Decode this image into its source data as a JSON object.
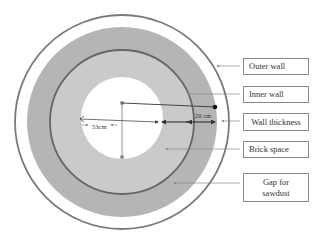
{
  "diagram": {
    "type": "concentric-circles cross-section",
    "labels": [
      {
        "id": "outer-wall",
        "text": "Outer wall"
      },
      {
        "id": "inner-wall",
        "text": "Inner wall"
      },
      {
        "id": "wall-thickness",
        "text": "Wall thickness"
      },
      {
        "id": "brick-space",
        "text": "Brick space"
      },
      {
        "id": "gap-sawdust",
        "text": "Gap for sawdust"
      }
    ],
    "dimensions": {
      "inner_radius": "53cm",
      "wall_thickness": "20 cm"
    },
    "colors": {
      "outer_ring_line": "#777777",
      "sawdust_gap": "#b4b4b4",
      "brick_space": "#cbcbcb",
      "inner_wall_line": "#666666",
      "hole": "#ffffff"
    }
  }
}
